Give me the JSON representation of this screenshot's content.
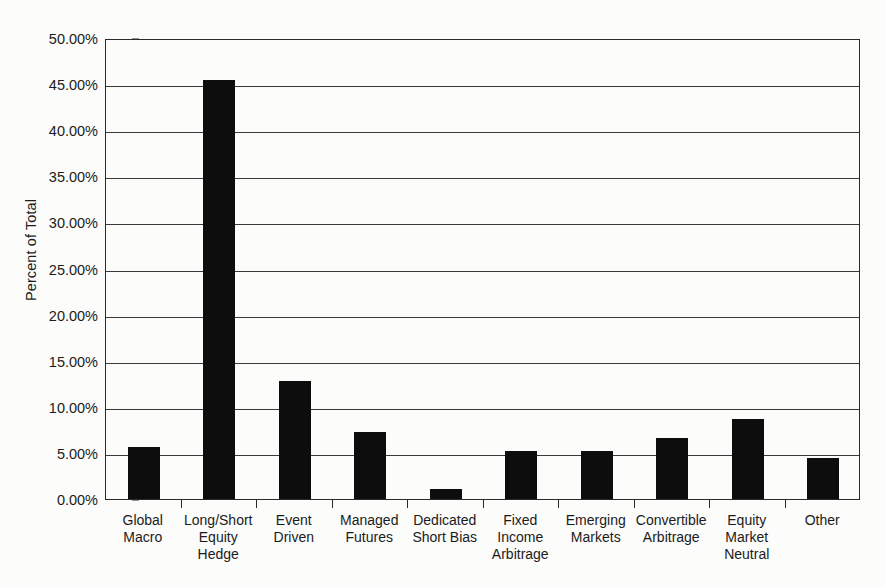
{
  "chart_data": {
    "type": "bar",
    "title": "",
    "xlabel": "",
    "ylabel": "Percent of Total",
    "ylim": [
      0,
      50
    ],
    "ytick_labels": [
      "0.00%",
      "5.00%",
      "10.00%",
      "15.00%",
      "20.00%",
      "25.00%",
      "30.00%",
      "35.00%",
      "40.00%",
      "45.00%",
      "50.00%"
    ],
    "ytick_values": [
      0,
      5,
      10,
      15,
      20,
      25,
      30,
      35,
      40,
      45,
      50
    ],
    "grid": true,
    "legend": "none",
    "bar_color": "#0d0d0d",
    "categories": [
      "Global Macro",
      "Long/Short Equity Hedge",
      "Event Driven",
      "Managed Futures",
      "Dedicated Short Bias",
      "Fixed Income Arbitrage",
      "Emerging Markets",
      "Convertible Arbitrage",
      "Equity Market Neutral",
      "Other"
    ],
    "category_lines": [
      [
        "Global",
        "Macro"
      ],
      [
        "Long/Short",
        "Equity",
        "Hedge"
      ],
      [
        "Event",
        "Driven"
      ],
      [
        "Managed",
        "Futures"
      ],
      [
        "Dedicated",
        "Short Bias"
      ],
      [
        "Fixed",
        "Income",
        "Arbitrage"
      ],
      [
        "Emerging",
        "Markets"
      ],
      [
        "Convertible",
        "Arbitrage"
      ],
      [
        "Equity",
        "Market",
        "Neutral"
      ],
      [
        "Other"
      ]
    ],
    "values": [
      5.6,
      45.5,
      12.8,
      7.3,
      1.1,
      5.2,
      5.2,
      6.6,
      8.7,
      4.4
    ]
  }
}
